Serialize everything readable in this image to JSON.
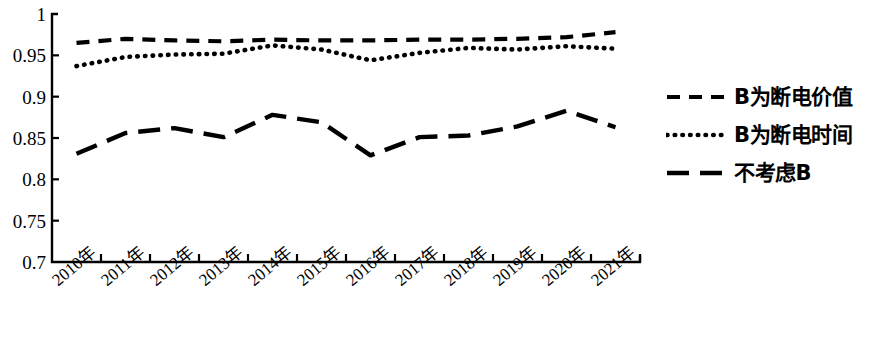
{
  "chart_data": {
    "type": "line",
    "title": "",
    "xlabel": "",
    "ylabel": "",
    "ylim": [
      0.7,
      1
    ],
    "ytick_labels": [
      "1",
      "0.95",
      "0.9",
      "0.85",
      "0.8",
      "0.75",
      "0.7"
    ],
    "ytick_values": [
      1,
      0.95,
      0.9,
      0.85,
      0.8,
      0.75,
      0.7
    ],
    "grid": false,
    "legend_position": "right",
    "categories": [
      "2010年",
      "2011年",
      "2012年",
      "2013年",
      "2014年",
      "2015年",
      "2016年",
      "2017年",
      "2018年",
      "2019年",
      "2020年",
      "2021年"
    ],
    "series": [
      {
        "name": "B为断电价值",
        "style": "dashed",
        "color": "#000000",
        "values": [
          0.965,
          0.97,
          0.968,
          0.967,
          0.969,
          0.968,
          0.968,
          0.969,
          0.969,
          0.97,
          0.972,
          0.978
        ]
      },
      {
        "name": "B为断电时间",
        "style": "dotted",
        "color": "#000000",
        "values": [
          0.937,
          0.948,
          0.951,
          0.952,
          0.962,
          0.957,
          0.944,
          0.953,
          0.959,
          0.957,
          0.961,
          0.958
        ]
      },
      {
        "name": "不考虑B",
        "style": "long-dashed",
        "color": "#000000",
        "values": [
          0.831,
          0.856,
          0.862,
          0.851,
          0.878,
          0.869,
          0.829,
          0.851,
          0.853,
          0.864,
          0.883,
          0.863
        ]
      }
    ]
  },
  "axis": {
    "y_labels": [
      {
        "text": "1",
        "value": 1.0
      },
      {
        "text": "0.95",
        "value": 0.95
      },
      {
        "text": "0.9",
        "value": 0.9
      },
      {
        "text": "0.85",
        "value": 0.85
      },
      {
        "text": "0.8",
        "value": 0.8
      },
      {
        "text": "0.75",
        "value": 0.75
      },
      {
        "text": "0.7",
        "value": 0.7
      }
    ]
  },
  "legend": {
    "items": [
      {
        "label": "B为断电价值",
        "style": "dashed"
      },
      {
        "label": "B为断电时间",
        "style": "dotted"
      },
      {
        "label": "不考虑B",
        "style": "long-dashed"
      }
    ]
  }
}
